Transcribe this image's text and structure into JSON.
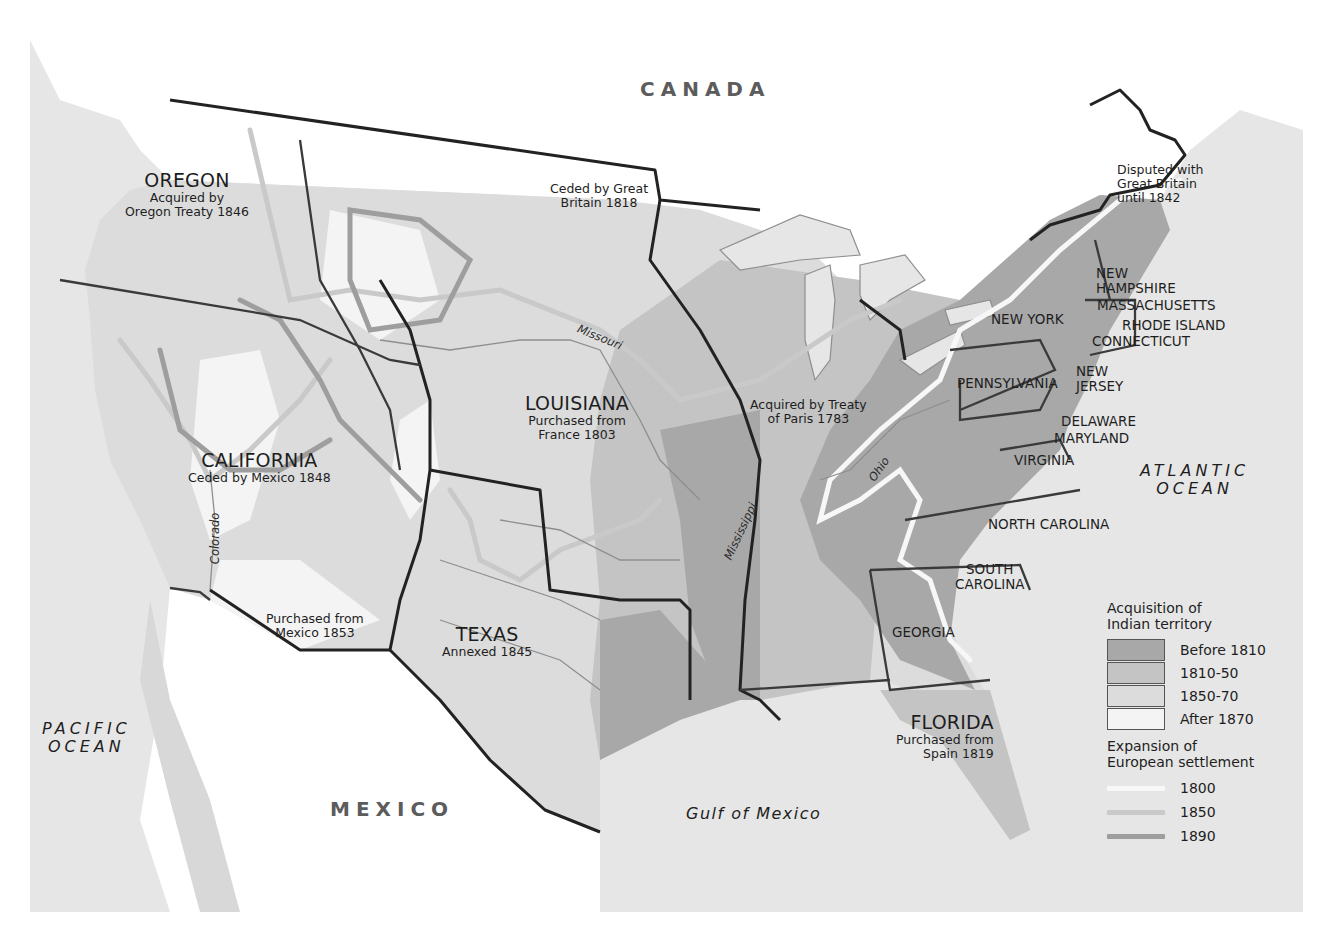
{
  "map": {
    "type": "historical-territorial-expansion-map",
    "colors": {
      "ocean": "#e6e6e6",
      "foreign_land": "#ffffff",
      "territory_before_1810": "#a8a8a8",
      "territory_1810_50": "#c4c4c4",
      "territory_1850_70": "#dcdcdc",
      "territory_after_1870": "#f4f4f4",
      "settlement_1800": "#f7f7f7",
      "settlement_1850": "#c9c9c9",
      "settlement_1890": "#9e9e9e",
      "boundary_dark": "#222222",
      "state_line": "#3a3a3a",
      "river": "#8e8e8e"
    }
  },
  "labels": {
    "countries": {
      "canada": "CANADA",
      "mexico": "MEXICO"
    },
    "water": {
      "pacific_line1": "PACIFIC",
      "pacific_line2": "OCEAN",
      "atlantic_line1": "ATLANTIC",
      "atlantic_line2": "OCEAN",
      "gulf": "Gulf of Mexico"
    },
    "rivers": {
      "missouri": "Missouri",
      "mississippi": "Mississippi",
      "ohio": "Ohio",
      "colorado": "Colorado"
    },
    "acquisitions": {
      "oregon_name": "OREGON",
      "oregon_line1": "Acquired by",
      "oregon_line2": "Oregon Treaty 1846",
      "california_name": "CALIFORNIA",
      "california_note": "Ceded by Mexico 1848",
      "louisiana_name": "LOUISIANA",
      "louisiana_line1": "Purchased from",
      "louisiana_line2": "France 1803",
      "texas_name": "TEXAS",
      "texas_note": "Annexed 1845",
      "florida_name": "FLORIDA",
      "florida_line1": "Purchased from",
      "florida_line2": "Spain 1819",
      "gadsden_line1": "Purchased from",
      "gadsden_line2": "Mexico 1853",
      "redriver_line1": "Ceded by Great",
      "redriver_line2": "Britain 1818",
      "paris_line1": "Acquired by Treaty",
      "paris_line2": "of Paris 1783",
      "maine_line1": "Disputed with",
      "maine_line2": "Great Britain",
      "maine_line3": "until 1842"
    },
    "states": {
      "new_hampshire_1": "NEW",
      "new_hampshire_2": "HAMPSHIRE",
      "massachusetts": "MASSACHUSETTS",
      "rhode_island": "RHODE ISLAND",
      "connecticut": "CONNECTICUT",
      "new_york": "NEW YORK",
      "new_jersey_1": "NEW",
      "new_jersey_2": "JERSEY",
      "pennsylvania": "PENNSYLVANIA",
      "delaware": "DELAWARE",
      "maryland": "MARYLAND",
      "virginia": "VIRGINIA",
      "north_carolina": "NORTH CAROLINA",
      "south_carolina_1": "SOUTH",
      "south_carolina_2": "CAROLINA",
      "georgia": "GEORGIA"
    }
  },
  "legend": {
    "acquisition_title_1": "Acquisition of",
    "acquisition_title_2": "Indian territory",
    "acquisition_items": [
      {
        "label": "Before 1810",
        "color": "#a8a8a8"
      },
      {
        "label": "1810-50",
        "color": "#c4c4c4"
      },
      {
        "label": "1850-70",
        "color": "#dcdcdc"
      },
      {
        "label": "After 1870",
        "color": "#f4f4f4"
      }
    ],
    "settlement_title_1": "Expansion of",
    "settlement_title_2": "European settlement",
    "settlement_items": [
      {
        "label": "1800",
        "color": "#f7f7f7"
      },
      {
        "label": "1850",
        "color": "#c9c9c9"
      },
      {
        "label": "1890",
        "color": "#9e9e9e"
      }
    ]
  }
}
